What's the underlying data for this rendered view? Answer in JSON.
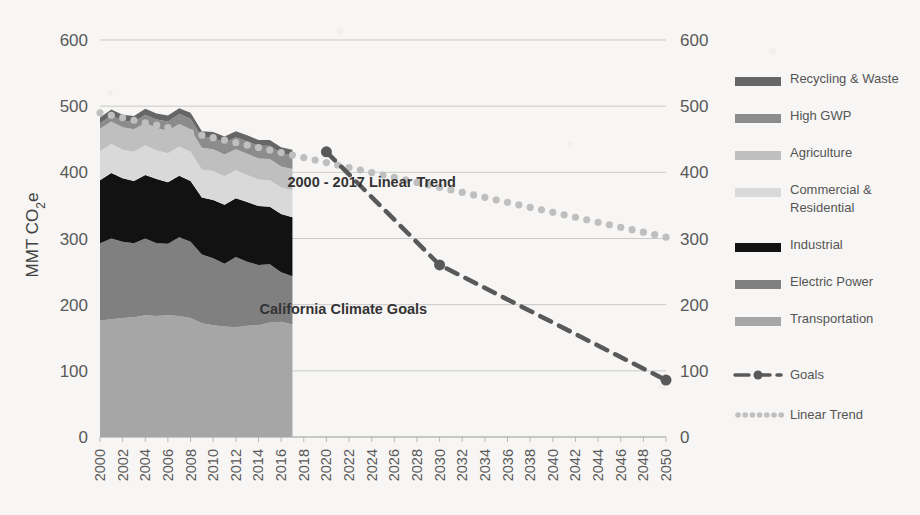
{
  "chart_data": {
    "type": "area",
    "title": "",
    "xlabel": "",
    "ylabel": "MMT CO 2e",
    "ylabel_parts": {
      "pre": "MMT CO",
      "sub": "2",
      "post": "e"
    },
    "xlim": [
      2000,
      2050
    ],
    "ylim": [
      0,
      600
    ],
    "yticks": [
      0,
      100,
      200,
      300,
      400,
      500,
      600
    ],
    "ytick_labels": [
      "0",
      "100",
      "200",
      "300",
      "400",
      "500",
      "600"
    ],
    "right_axis": true,
    "grid": "horizontal",
    "legend_position": "right",
    "categories": [
      2000,
      2001,
      2002,
      2003,
      2004,
      2005,
      2006,
      2007,
      2008,
      2009,
      2010,
      2011,
      2012,
      2013,
      2014,
      2015,
      2016,
      2017
    ],
    "xtick_labels": [
      "2000",
      "2002",
      "2004",
      "2006",
      "2008",
      "2010",
      "2012",
      "2014",
      "2016",
      "2018",
      "2020",
      "2022",
      "2024",
      "2026",
      "2028",
      "2030",
      "2032",
      "2034",
      "2036",
      "2038",
      "2040",
      "2042",
      "2044",
      "2046",
      "2048",
      "2050"
    ],
    "stack_order_bottom_to_top": [
      "Transportation",
      "Electric Power",
      "Industrial",
      "Commercial & Residential",
      "Agriculture",
      "High GWP",
      "Recycling & Waste"
    ],
    "series": [
      {
        "name": "Transportation",
        "color": "#a6a6a6",
        "values": [
          176,
          178,
          180,
          181,
          184,
          183,
          184,
          183,
          180,
          172,
          169,
          167,
          166,
          168,
          169,
          173,
          174,
          170
        ]
      },
      {
        "name": "Electric Power",
        "color": "#808080",
        "values": [
          117,
          122,
          115,
          112,
          116,
          110,
          108,
          119,
          115,
          104,
          101,
          95,
          106,
          97,
          91,
          88,
          75,
          73
        ]
      },
      {
        "name": "Industrial",
        "color": "#121212",
        "values": [
          95,
          99,
          96,
          94,
          96,
          97,
          93,
          93,
          92,
          86,
          88,
          89,
          89,
          90,
          89,
          87,
          88,
          89
        ]
      },
      {
        "name": "Commercial & Residential",
        "color": "#d9d9d9",
        "values": [
          44,
          44,
          43,
          44,
          45,
          43,
          44,
          44,
          44,
          42,
          44,
          43,
          42,
          41,
          40,
          40,
          40,
          41
        ]
      },
      {
        "name": "Agriculture",
        "color": "#bfbfbf",
        "values": [
          34,
          34,
          34,
          34,
          34,
          34,
          34,
          34,
          34,
          33,
          33,
          33,
          32,
          32,
          32,
          32,
          32,
          32
        ]
      },
      {
        "name": "High GWP",
        "color": "#8c8c8c",
        "values": [
          8,
          9,
          10,
          11,
          12,
          13,
          14,
          15,
          16,
          16,
          17,
          18,
          18,
          19,
          19,
          20,
          20,
          20
        ]
      },
      {
        "name": "Recycling & Waste",
        "color": "#666666",
        "values": [
          9,
          9,
          9,
          9,
          9,
          9,
          9,
          9,
          9,
          9,
          9,
          9,
          9,
          9,
          9,
          9,
          9,
          9
        ]
      }
    ],
    "goals": {
      "name": "Goals",
      "color": "#595959",
      "style": "dashed-with-markers",
      "points": [
        {
          "x": 2020,
          "y": 431
        },
        {
          "x": 2030,
          "y": 260
        },
        {
          "x": 2050,
          "y": 86
        }
      ]
    },
    "linear_trend": {
      "name": "Linear Trend",
      "color": "#bfbfbf",
      "style": "dotted",
      "x_start": 2000,
      "x_end": 2050,
      "y_start": 490,
      "y_end": 302,
      "note": "2000 - 2017 fitted line extended to 2050"
    },
    "annotations": [
      {
        "text": "2000 - 2017 Linear Trend",
        "x": 2024,
        "y": 378
      },
      {
        "text": "California Climate Goals",
        "x": 2021.5,
        "y": 186
      }
    ]
  },
  "legend": {
    "series_items": [
      {
        "label": "Recycling & Waste",
        "color": "#666666"
      },
      {
        "label": "High GWP",
        "color": "#8c8c8c"
      },
      {
        "label": "Agriculture",
        "color": "#bfbfbf"
      },
      {
        "label": "Commercial & Residential",
        "color": "#d9d9d9",
        "line2": "Residential",
        "line1": "Commercial &"
      },
      {
        "label": "Industrial",
        "color": "#121212"
      },
      {
        "label": "Electric Power",
        "color": "#808080"
      },
      {
        "label": "Transportation",
        "color": "#a6a6a6"
      }
    ],
    "line_items": [
      {
        "label": "Goals",
        "color": "#595959",
        "style": "dashed"
      },
      {
        "label": "Linear Trend",
        "color": "#bfbfbf",
        "style": "dotted"
      }
    ]
  },
  "colors": {
    "background": "#f7f6f4",
    "grid": "#c9c9c9",
    "text": "#595959",
    "annotation": "#333333"
  }
}
